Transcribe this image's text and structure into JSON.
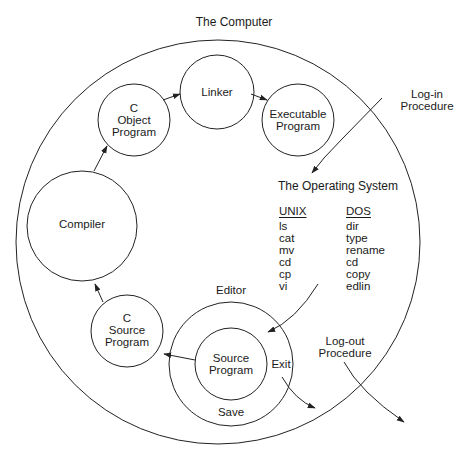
{
  "title": "The Computer",
  "nodes": {
    "linker": {
      "label": "Linker"
    },
    "object_program": {
      "lines": [
        "C",
        "Object",
        "Program"
      ]
    },
    "executable_program": {
      "lines": [
        "Executable",
        "Program"
      ]
    },
    "compiler": {
      "label": "Compiler"
    },
    "source_program_c": {
      "lines": [
        "C",
        "Source",
        "Program"
      ]
    },
    "editor": {
      "label": "Editor",
      "save_label": "Save",
      "exit_label": "Exit"
    },
    "source_program_editor": {
      "lines": [
        "Source",
        "Program"
      ]
    }
  },
  "login": {
    "lines": [
      "Log-in",
      "Procedure"
    ]
  },
  "logout": {
    "lines": [
      "Log-out",
      "Procedure"
    ]
  },
  "operating_system": {
    "title": "The Operating System",
    "unix": {
      "header": "UNIX",
      "commands": [
        "ls",
        "cat",
        "mv",
        "cd",
        "cp",
        "vi"
      ]
    },
    "dos": {
      "header": "DOS",
      "commands": [
        "dir",
        "type",
        "rename",
        "cd",
        "copy",
        "edlin"
      ]
    }
  },
  "colors": {
    "stroke": "#222222",
    "text": "#1a1a1a",
    "background": "#ffffff"
  }
}
